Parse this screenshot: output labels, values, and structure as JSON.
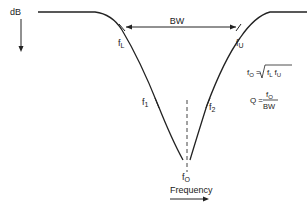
{
  "diagram": {
    "y_axis_label": "dB",
    "x_axis_label": "Frequency",
    "bandwidth_label": "BW",
    "points": {
      "lower_cutoff": {
        "symbol": "f",
        "sub": "L"
      },
      "upper_cutoff": {
        "symbol": "f",
        "sub": "U"
      },
      "f1": {
        "symbol": "f",
        "sub": "1"
      },
      "f2": {
        "symbol": "f",
        "sub": "2"
      },
      "center": {
        "symbol": "f",
        "sub": "O"
      }
    },
    "formulas": {
      "center_frequency": {
        "lhs": "f",
        "lhs_sub": "O",
        "eq": "=",
        "radicand_a": "f",
        "radicand_a_sub": "L",
        "radicand_b": "f",
        "radicand_b_sub": "U"
      },
      "quality_factor": {
        "lhs": "Q",
        "eq": "=",
        "numerator": "f",
        "numerator_sub": "O",
        "denominator": "BW"
      }
    }
  },
  "colors": {
    "line": "#222222",
    "background": "#ffffff"
  }
}
